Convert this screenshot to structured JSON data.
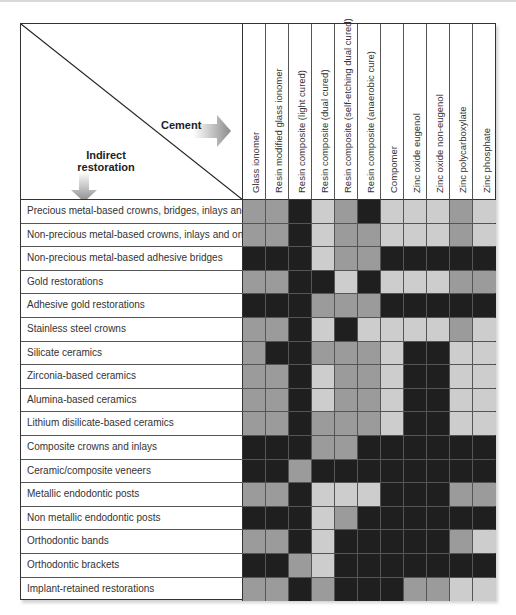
{
  "corner": {
    "column_axis_label": "Cement",
    "row_axis_label_line1": "Indirect",
    "row_axis_label_line2": "restoration"
  },
  "legend_shades": {
    "dark": "#1f1f1f",
    "mid": "#9b9b9b",
    "light": "#cdcdcd"
  },
  "chart_data": {
    "type": "heatmap",
    "title": "",
    "xlabel": "Cement",
    "ylabel": "Indirect restoration",
    "value_scale": "3 grayscale levels: dark / mid / light (no legend shown)",
    "columns": [
      "Glass ionomer",
      "Resin modified glass ionomer",
      "Resin composite (light cured)",
      "Resin composite (dual cured)",
      "Resin composite (self-etching dual cured)",
      "Resin composite (anaerobic cure)",
      "Compomer",
      "Zinc oxide eugenol",
      "Zinc oxide non-eugenol",
      "Zinc polycarboxylate",
      "Zinc phosphate"
    ],
    "rows": [
      {
        "label": "Precious metal-based crowns, bridges, inlays and onlays",
        "values": [
          "mid",
          "mid",
          "dark",
          "light",
          "mid",
          "dark",
          "light",
          "light",
          "light",
          "mid",
          "light"
        ]
      },
      {
        "label": "Non-precious metal-based crowns, inlays and onlays",
        "values": [
          "mid",
          "mid",
          "dark",
          "light",
          "mid",
          "mid",
          "light",
          "light",
          "light",
          "mid",
          "light"
        ]
      },
      {
        "label": "Non-precious metal-based adhesive bridges",
        "values": [
          "dark",
          "dark",
          "dark",
          "light",
          "mid",
          "mid",
          "dark",
          "dark",
          "dark",
          "dark",
          "dark"
        ]
      },
      {
        "label": "Gold restorations",
        "values": [
          "mid",
          "mid",
          "dark",
          "dark",
          "light",
          "dark",
          "light",
          "light",
          "light",
          "mid",
          "mid"
        ]
      },
      {
        "label": "Adhesive gold restorations",
        "values": [
          "dark",
          "dark",
          "dark",
          "mid",
          "mid",
          "mid",
          "dark",
          "dark",
          "dark",
          "dark",
          "dark"
        ]
      },
      {
        "label": "Stainless steel crowns",
        "values": [
          "mid",
          "mid",
          "dark",
          "light",
          "dark",
          "light",
          "light",
          "light",
          "light",
          "mid",
          "light"
        ]
      },
      {
        "label": "Silicate ceramics",
        "values": [
          "mid",
          "dark",
          "dark",
          "mid",
          "mid",
          "mid",
          "light",
          "dark",
          "dark",
          "light",
          "light"
        ]
      },
      {
        "label": "Zirconia-based ceramics",
        "values": [
          "mid",
          "mid",
          "dark",
          "light",
          "mid",
          "mid",
          "light",
          "dark",
          "dark",
          "light",
          "light"
        ]
      },
      {
        "label": "Alumina-based ceramics",
        "values": [
          "mid",
          "mid",
          "dark",
          "light",
          "mid",
          "mid",
          "light",
          "dark",
          "dark",
          "light",
          "light"
        ]
      },
      {
        "label": "Lithium disilicate-based ceramics",
        "values": [
          "mid",
          "mid",
          "dark",
          "mid",
          "mid",
          "mid",
          "light",
          "dark",
          "dark",
          "light",
          "light"
        ]
      },
      {
        "label": "Composite crowns and inlays",
        "values": [
          "dark",
          "dark",
          "dark",
          "mid",
          "mid",
          "dark",
          "dark",
          "dark",
          "dark",
          "dark",
          "dark"
        ]
      },
      {
        "label": "Ceramic/composite veneers",
        "values": [
          "dark",
          "dark",
          "mid",
          "dark",
          "dark",
          "dark",
          "dark",
          "dark",
          "dark",
          "dark",
          "dark"
        ]
      },
      {
        "label": "Metallic endodontic posts",
        "values": [
          "mid",
          "mid",
          "dark",
          "light",
          "light",
          "light",
          "dark",
          "dark",
          "dark",
          "mid",
          "mid"
        ]
      },
      {
        "label": "Non metallic endodontic posts",
        "values": [
          "dark",
          "dark",
          "dark",
          "light",
          "mid",
          "dark",
          "dark",
          "dark",
          "dark",
          "dark",
          "dark"
        ]
      },
      {
        "label": "Orthodontic bands",
        "values": [
          "mid",
          "mid",
          "dark",
          "light",
          "dark",
          "dark",
          "dark",
          "dark",
          "dark",
          "mid",
          "light"
        ]
      },
      {
        "label": "Orthodontic brackets",
        "values": [
          "dark",
          "dark",
          "mid",
          "light",
          "dark",
          "dark",
          "dark",
          "dark",
          "dark",
          "dark",
          "dark"
        ]
      },
      {
        "label": "Implant-retained restorations",
        "values": [
          "mid",
          "mid",
          "dark",
          "mid",
          "dark",
          "dark",
          "dark",
          "mid",
          "mid",
          "light",
          "light"
        ]
      }
    ]
  }
}
